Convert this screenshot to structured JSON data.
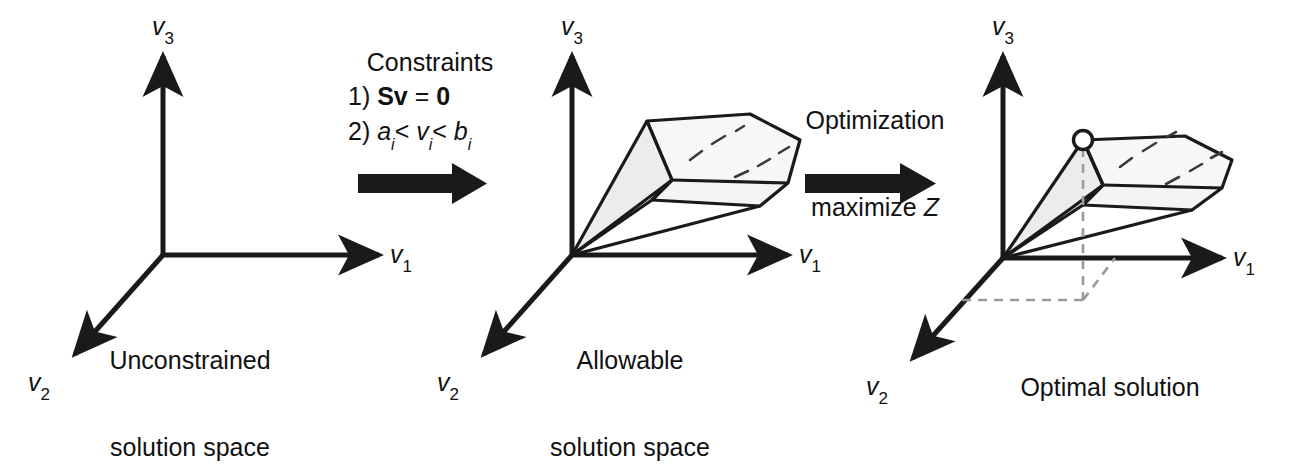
{
  "figure": {
    "background_color": "#ffffff",
    "ink_color": "#1a1a1a",
    "face_fill_color": "#ececec",
    "dashed_color": "#9a9a9a"
  },
  "axes": {
    "v1_label_text": "v",
    "v1_label_sub": "1",
    "v2_label_text": "v",
    "v2_label_sub": "2",
    "v3_label_text": "v",
    "v3_label_sub": "3"
  },
  "panels": [
    {
      "id": "unconstrained",
      "caption_line1": "Unconstrained",
      "caption_line2": "solution space",
      "has_solution_region": false,
      "has_optimum": false
    },
    {
      "id": "allowable",
      "caption_line1": "Allowable",
      "caption_line2": "solution space",
      "has_solution_region": true,
      "has_optimum": false
    },
    {
      "id": "optimal",
      "caption_line1": "Optimal solution",
      "caption_line2": "",
      "has_solution_region": true,
      "has_optimum": true
    }
  ],
  "transitions": [
    {
      "id": "constraints",
      "title": "Constraints",
      "items": [
        {
          "number": "1)",
          "expr_plain": "Sv = 0"
        },
        {
          "number": "2)",
          "expr_plain": "ai < vi < bi"
        }
      ],
      "arrow": "right-block-arrow"
    },
    {
      "id": "optimization",
      "title_line1": "Optimization",
      "title_line2": "maximize Z",
      "arrow": "right-block-arrow"
    }
  ],
  "constraint_tokens": {
    "eq1_matrix": "Sv",
    "eq1_equals": "=",
    "eq1_zero": "0",
    "eq2_a": "a",
    "eq2_lt1": "<",
    "eq2_v": "v",
    "eq2_lt2": "<",
    "eq2_b": "b",
    "eq2_sub": "i"
  },
  "optimization_tokens": {
    "word_maximize": "maximize",
    "objective_symbol": "Z",
    "word_optimization": "Optimization"
  }
}
